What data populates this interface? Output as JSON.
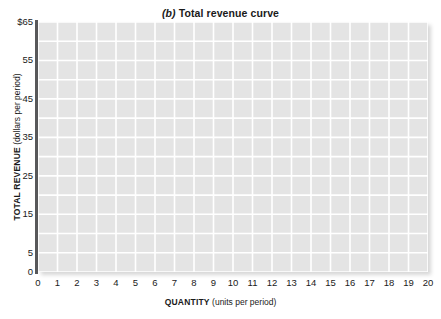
{
  "chart_data": {
    "type": "line",
    "title": "(b) Total revenue curve",
    "title_prefix": "(b)",
    "title_rest": "Total revenue curve",
    "xlabel_strong": "QUANTITY",
    "xlabel_light": "(units per period)",
    "ylabel_strong": "TOTAL REVENUE",
    "ylabel_light": "(dollars per period)",
    "xlim": [
      0,
      20
    ],
    "ylim": [
      0,
      65
    ],
    "x_tick_labels": [
      "0",
      "1",
      "2",
      "3",
      "4",
      "5",
      "6",
      "7",
      "8",
      "9",
      "10",
      "11",
      "12",
      "13",
      "14",
      "15",
      "16",
      "17",
      "18",
      "19",
      "20"
    ],
    "x_tick_values": [
      0,
      1,
      2,
      3,
      4,
      5,
      6,
      7,
      8,
      9,
      10,
      11,
      12,
      13,
      14,
      15,
      16,
      17,
      18,
      19,
      20
    ],
    "y_tick_labels": [
      "$65",
      "55",
      "45",
      "35",
      "25",
      "15",
      "5",
      "0"
    ],
    "y_tick_values": [
      65,
      55,
      45,
      35,
      25,
      15,
      5,
      0
    ],
    "x_gridline_step": 1,
    "y_gridline_step": 5,
    "grid": true,
    "legend": null,
    "series": [],
    "values": [],
    "annotations": [],
    "note": "Empty grid — no data curve plotted",
    "colors": {
      "plot_background": "#e4e4e4",
      "gridline": "#ffffff",
      "axis_spine": "#58585a",
      "text": "#1a1a1a",
      "page_background": "#ffffff"
    }
  }
}
